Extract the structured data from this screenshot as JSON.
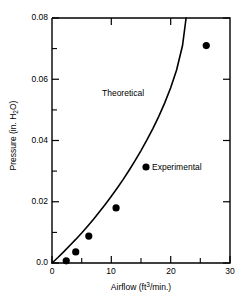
{
  "chart_data": {
    "type": "scatter",
    "title": "",
    "xlabel": "Airflow (ft3/min.)",
    "ylabel": "Pressure (in. H2O)",
    "xlim": [
      0,
      30
    ],
    "ylim": [
      0,
      0.08
    ],
    "grid": false,
    "legend_position": "inside-right",
    "x_major_ticks": [
      0,
      10,
      20,
      30
    ],
    "x_major_tick_labels": [
      "0",
      "10",
      "20",
      "30"
    ],
    "x_minor_ticks": [
      5,
      15,
      25
    ],
    "y_major_ticks": [
      0,
      0.02,
      0.04,
      0.06,
      0.08
    ],
    "y_major_tick_labels": [
      "0.0",
      "0.02",
      "0.04",
      "0.06",
      "0.08"
    ],
    "y_minor_ticks": [
      0.01,
      0.03,
      0.05,
      0.07
    ],
    "series": [
      {
        "name": "Theoretical",
        "type": "line",
        "color": "#000000",
        "x": [
          0,
          1,
          2,
          3,
          4,
          5,
          6,
          7,
          8,
          9,
          10,
          11,
          12,
          13,
          14,
          15,
          16,
          17,
          18,
          19,
          20,
          21,
          22,
          22.6
        ],
        "y": [
          0.0,
          0.0018,
          0.0037,
          0.0057,
          0.0077,
          0.0098,
          0.012,
          0.0143,
          0.0167,
          0.0192,
          0.0218,
          0.0245,
          0.0273,
          0.0303,
          0.0334,
          0.0367,
          0.0402,
          0.0439,
          0.0479,
          0.0523,
          0.0572,
          0.063,
          0.071,
          0.08
        ]
      },
      {
        "name": "Experimental",
        "type": "scatter",
        "color": "#000000",
        "marker": "filled-circle",
        "x": [
          2.4,
          4.0,
          6.2,
          10.8,
          26.0
        ],
        "y": [
          0.0007,
          0.0036,
          0.0088,
          0.018,
          0.071
        ]
      }
    ],
    "annotations": [
      {
        "text": "Theoretical",
        "x": 8.4,
        "y": 0.0565
      },
      {
        "text": "Experimental",
        "x": 16.9,
        "y": 0.0315
      }
    ]
  },
  "axis_labels": {
    "x_title_pre": "Airflow (ft",
    "x_title_sup": "3",
    "x_title_post": "/min.)",
    "y_title_pre": "Pressure (in. H",
    "y_title_sub": "2",
    "y_title_post": "O)"
  },
  "annotation_labels": {
    "theoretical": "Theoretical",
    "experimental": "Experimental"
  },
  "colors": {
    "axis": "#000000",
    "curve": "#000000",
    "marker": "#000000",
    "background": "#ffffff"
  }
}
